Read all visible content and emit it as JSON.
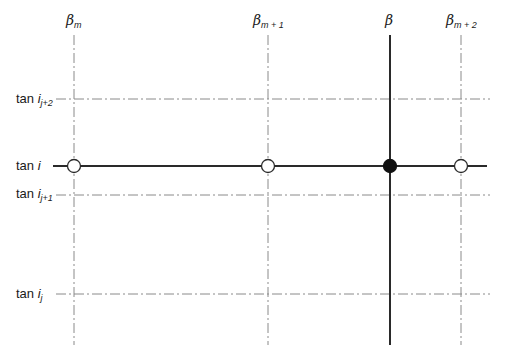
{
  "diagram": {
    "type": "grid-interpolation-diagram",
    "colors": {
      "line": "#2a2a2a",
      "dashdot": "#8a8a8a",
      "filled_node": "#111111",
      "open_node": "#ffffff"
    },
    "vertical_lines": [
      {
        "id": "beta_m",
        "symbol": "β",
        "sub": "m",
        "x": 74,
        "style": "dash-dot"
      },
      {
        "id": "beta_m1",
        "symbol": "β",
        "sub": "m + 1",
        "x": 268,
        "style": "dash-dot"
      },
      {
        "id": "beta",
        "symbol": "β",
        "sub": "",
        "x": 390,
        "style": "solid"
      },
      {
        "id": "beta_m2",
        "symbol": "β",
        "sub": "m + 2",
        "x": 461,
        "style": "dash-dot"
      }
    ],
    "horizontal_lines": [
      {
        "id": "tan_ij2",
        "prefix": "tan",
        "var": "i",
        "sub": "j+2",
        "y": 99,
        "style": "dash-dot"
      },
      {
        "id": "tan_i",
        "prefix": "tan",
        "var": "i",
        "sub": "",
        "y": 166,
        "style": "solid"
      },
      {
        "id": "tan_ij1",
        "prefix": "tan",
        "var": "i",
        "sub": "j+1",
        "y": 195,
        "style": "dash-dot"
      },
      {
        "id": "tan_ij",
        "prefix": "tan",
        "var": "i",
        "sub": "j",
        "y": 294,
        "style": "dash-dot"
      }
    ],
    "nodes": [
      {
        "x": 74,
        "y": 166,
        "filled": false
      },
      {
        "x": 268,
        "y": 166,
        "filled": false
      },
      {
        "x": 390,
        "y": 166,
        "filled": true
      },
      {
        "x": 461,
        "y": 166,
        "filled": false
      }
    ]
  },
  "labels": {
    "beta_m": {
      "symbol": "β",
      "sub": "m"
    },
    "beta_m1": {
      "symbol": "β",
      "sub": "m + 1"
    },
    "beta": {
      "symbol": "β"
    },
    "beta_m2": {
      "symbol": "β",
      "sub": "m + 2"
    },
    "tan_ij2": {
      "prefix": "tan",
      "var": "i",
      "sub": "j+2"
    },
    "tan_i": {
      "prefix": "tan",
      "var": "i"
    },
    "tan_ij1": {
      "prefix": "tan",
      "var": "i",
      "sub": "j+1"
    },
    "tan_ij": {
      "prefix": "tan",
      "var": "i",
      "sub": "j"
    }
  }
}
